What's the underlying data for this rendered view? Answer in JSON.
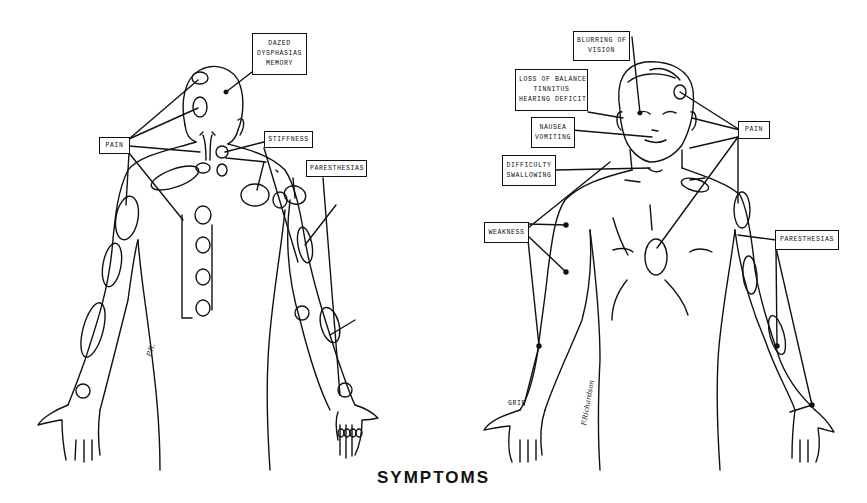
{
  "caption": "SYMPTOMS",
  "posterior_figure": {
    "labels": {
      "dazed": [
        "DAZED",
        "DYSPHASIAS",
        "MEMORY"
      ],
      "pain": "PAIN",
      "stiffness": "STIFFNESS",
      "paresthesias": "PARESTHESIAS"
    },
    "signature": "P.R."
  },
  "anterior_figure": {
    "labels": {
      "blurring": [
        "BLURRING OF",
        "VISION"
      ],
      "balance": [
        "LOSS OF BALANCE",
        "TINNITUS",
        "HEARING DEFICIT"
      ],
      "nausea": [
        "NAUSEA",
        "VOMITING"
      ],
      "swallowing": [
        "DIFFICULTY",
        "SWALLOWING"
      ],
      "pain": "PAIN",
      "weakness": "WEAKNESS",
      "paresthesias": "PARESTHESIAS",
      "grip": "GRIP"
    },
    "signature": "F.Richardson"
  },
  "colors": {
    "ink": "#111111",
    "paper": "#ffffff"
  }
}
